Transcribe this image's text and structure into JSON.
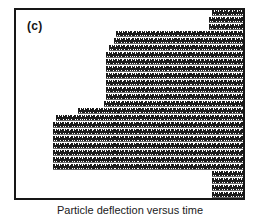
{
  "figure": {
    "panel_label": "(c)",
    "caption": "Particle deflection versus time",
    "frame": {
      "border_color": "#171717",
      "background_color": "#ffffff",
      "border_width_px": 2,
      "left_px": 14,
      "top_px": 8,
      "width_px": 231,
      "height_px": 192
    },
    "mark": {
      "icon_name": "zigzag-wave-mark",
      "color": "#1b1b1b",
      "period_px": 4.6,
      "stroke_px": 1.2,
      "row_height_px": 7
    }
  },
  "chart_data": {
    "type": "area",
    "title": "",
    "xlabel": "",
    "ylabel": "",
    "grid": false,
    "legend_position": "none",
    "xlim": [
      0,
      227
    ],
    "ylim": [
      0,
      188
    ],
    "row_unit": "px",
    "rows": [
      {
        "index": 0,
        "y": 6,
        "x_start": 196,
        "x_end": 227
      },
      {
        "index": 1,
        "y": 13,
        "x_start": 193,
        "x_end": 227
      },
      {
        "index": 2,
        "y": 20,
        "x_start": 193,
        "x_end": 227
      },
      {
        "index": 3,
        "y": 27,
        "x_start": 100,
        "x_end": 227
      },
      {
        "index": 4,
        "y": 34,
        "x_start": 98,
        "x_end": 227
      },
      {
        "index": 5,
        "y": 41,
        "x_start": 93,
        "x_end": 227
      },
      {
        "index": 6,
        "y": 48,
        "x_start": 90,
        "x_end": 227
      },
      {
        "index": 7,
        "y": 55,
        "x_start": 90,
        "x_end": 227
      },
      {
        "index": 8,
        "y": 62,
        "x_start": 90,
        "x_end": 227
      },
      {
        "index": 9,
        "y": 69,
        "x_start": 90,
        "x_end": 227
      },
      {
        "index": 10,
        "y": 76,
        "x_start": 90,
        "x_end": 227
      },
      {
        "index": 11,
        "y": 83,
        "x_start": 90,
        "x_end": 227
      },
      {
        "index": 12,
        "y": 90,
        "x_start": 90,
        "x_end": 227
      },
      {
        "index": 13,
        "y": 97,
        "x_start": 88,
        "x_end": 227
      },
      {
        "index": 14,
        "y": 104,
        "x_start": 62,
        "x_end": 227
      },
      {
        "index": 15,
        "y": 111,
        "x_start": 40,
        "x_end": 227
      },
      {
        "index": 16,
        "y": 118,
        "x_start": 37,
        "x_end": 227
      },
      {
        "index": 17,
        "y": 125,
        "x_start": 37,
        "x_end": 227
      },
      {
        "index": 18,
        "y": 132,
        "x_start": 37,
        "x_end": 227
      },
      {
        "index": 19,
        "y": 139,
        "x_start": 37,
        "x_end": 227
      },
      {
        "index": 20,
        "y": 146,
        "x_start": 37,
        "x_end": 227
      },
      {
        "index": 21,
        "y": 153,
        "x_start": 37,
        "x_end": 227
      },
      {
        "index": 22,
        "y": 160,
        "x_start": 37,
        "x_end": 227
      },
      {
        "index": 23,
        "y": 167,
        "x_start": 196,
        "x_end": 227
      },
      {
        "index": 24,
        "y": 174,
        "x_start": 196,
        "x_end": 227
      },
      {
        "index": 25,
        "y": 181,
        "x_start": 196,
        "x_end": 227
      },
      {
        "index": 26,
        "y": 188,
        "x_start": 196,
        "x_end": 227
      }
    ]
  }
}
